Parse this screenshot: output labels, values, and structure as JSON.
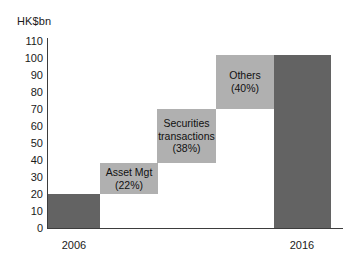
{
  "chart_data": {
    "type": "bar",
    "subtype": "waterfall",
    "title": "",
    "xlabel": "",
    "ylabel": "HK$bn",
    "ylim": [
      0,
      110
    ],
    "ytick_step": 10,
    "yticks": [
      "110",
      "100",
      "90",
      "80",
      "70",
      "60",
      "50",
      "40",
      "30",
      "20",
      "10",
      "0"
    ],
    "grid": false,
    "legend": "none",
    "categories": [
      "2006",
      "Asset Mgt",
      "Securities transactions",
      "Others",
      "2016"
    ],
    "x_axis_labels": [
      "2006",
      "2016"
    ],
    "bars": [
      {
        "name": "2006",
        "kind": "total",
        "base": 0,
        "top": 20,
        "value": 20,
        "color": "#636363",
        "label_lines": [],
        "percent": ""
      },
      {
        "name": "Asset Mgt",
        "kind": "increment",
        "base": 20,
        "top": 38,
        "value": 18,
        "color": "#b0b0b0",
        "label_lines": [
          "Asset Mgt",
          "(22%)"
        ],
        "percent": "22%"
      },
      {
        "name": "Securities transactions",
        "kind": "increment",
        "base": 38,
        "top": 70,
        "value": 32,
        "color": "#b0b0b0",
        "label_lines": [
          "Securities",
          "transactions",
          "(38%)"
        ],
        "percent": "38%"
      },
      {
        "name": "Others",
        "kind": "increment",
        "base": 70,
        "top": 102,
        "value": 32,
        "color": "#b0b0b0",
        "label_lines": [
          "Others",
          "(40%)"
        ],
        "percent": "40%"
      },
      {
        "name": "2016",
        "kind": "total",
        "base": 0,
        "top": 102,
        "value": 102,
        "color": "#636363",
        "label_lines": [],
        "percent": ""
      }
    ]
  },
  "axis": {
    "unit_label": "HK$bn",
    "axis_color": "#3d3d3d"
  },
  "colors": {
    "dark_bar": "#636363",
    "light_bar": "#b0b0b0",
    "background": "#ffffff",
    "text": "#1a1a1a"
  },
  "x_labels": [
    {
      "text": "2006",
      "center": 74
    },
    {
      "text": "2016",
      "center": 302
    }
  ],
  "geometry": {
    "plot_left": 47,
    "plot_bottom": 228,
    "plot_top": 41,
    "bar_rects": [
      {
        "x": 48,
        "w": 52
      },
      {
        "x": 100,
        "w": 58
      },
      {
        "x": 157,
        "w": 59
      },
      {
        "x": 216,
        "w": 58
      },
      {
        "x": 274,
        "w": 57
      }
    ]
  }
}
